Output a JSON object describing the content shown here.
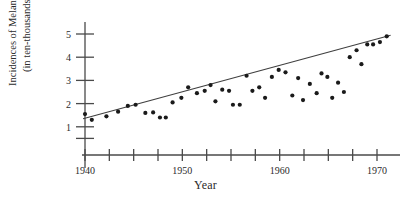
{
  "chart_data": {
    "type": "scatter",
    "title": "",
    "xlabel": "Year",
    "ylabel_line1": "Incidences of Melanoma",
    "ylabel_line2": "(in ten-thousands)",
    "xlim": [
      1939.0,
      1972.5
    ],
    "ylim": [
      0.0,
      5.7
    ],
    "grid": false,
    "legend": "none",
    "xticks_labeled": [
      "1940",
      "1950",
      "1960",
      "1970"
    ],
    "xticks_labeled_values": [
      1940,
      1950,
      1960,
      1970
    ],
    "xticks_all_values": [
      1940,
      1942.5,
      1945,
      1947.5,
      1950,
      1952.5,
      1955,
      1957.5,
      1960,
      1962.5,
      1965,
      1967.5,
      1970
    ],
    "yticks_labeled": [
      "1",
      "2",
      "3",
      "4",
      "5"
    ],
    "yticks_labeled_values": [
      1,
      2,
      3,
      4,
      5
    ],
    "yticks_all_values": [
      0.5,
      1,
      2,
      3,
      4,
      5
    ],
    "marker_color": "#1a1a1a",
    "line_color": "#3f3f3f",
    "axis_color": "#4a4a4a",
    "series": [
      {
        "name": "Melanoma incidences",
        "points": [
          [
            1940.0,
            1.55
          ],
          [
            1940.7,
            1.3
          ],
          [
            1942.2,
            1.45
          ],
          [
            1943.4,
            1.65
          ],
          [
            1944.4,
            1.9
          ],
          [
            1945.2,
            1.95
          ],
          [
            1946.2,
            1.6
          ],
          [
            1947.0,
            1.62
          ],
          [
            1947.7,
            1.4
          ],
          [
            1948.3,
            1.4
          ],
          [
            1949.0,
            2.05
          ],
          [
            1949.9,
            2.25
          ],
          [
            1950.6,
            2.7
          ],
          [
            1951.5,
            2.45
          ],
          [
            1952.3,
            2.55
          ],
          [
            1952.9,
            2.8
          ],
          [
            1953.4,
            2.1
          ],
          [
            1954.1,
            2.6
          ],
          [
            1954.8,
            2.55
          ],
          [
            1955.2,
            1.95
          ],
          [
            1955.9,
            1.95
          ],
          [
            1956.6,
            3.2
          ],
          [
            1957.2,
            2.55
          ],
          [
            1957.9,
            2.7
          ],
          [
            1958.5,
            2.25
          ],
          [
            1959.2,
            3.15
          ],
          [
            1959.9,
            3.45
          ],
          [
            1960.6,
            3.35
          ],
          [
            1961.3,
            2.35
          ],
          [
            1961.9,
            3.1
          ],
          [
            1962.4,
            2.15
          ],
          [
            1963.1,
            2.85
          ],
          [
            1963.8,
            2.45
          ],
          [
            1964.3,
            3.3
          ],
          [
            1964.9,
            3.15
          ],
          [
            1965.4,
            2.25
          ],
          [
            1966.0,
            2.9
          ],
          [
            1966.6,
            2.5
          ],
          [
            1967.2,
            4.0
          ],
          [
            1967.9,
            4.3
          ],
          [
            1968.4,
            3.7
          ],
          [
            1969.0,
            4.55
          ],
          [
            1969.6,
            4.55
          ],
          [
            1970.3,
            4.65
          ],
          [
            1971.0,
            4.9
          ]
        ]
      }
    ],
    "trendline": {
      "name": "least-squares fit",
      "x_start": 1939.8,
      "y_start": 1.35,
      "x_end": 1971.4,
      "y_end": 4.95
    }
  }
}
